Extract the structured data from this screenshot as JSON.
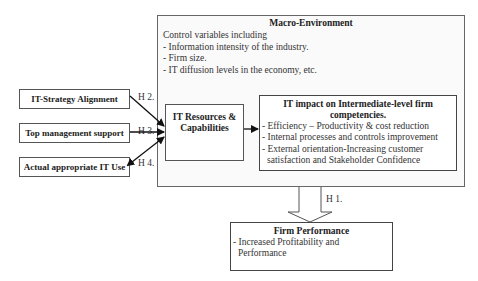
{
  "macro_environment": {
    "title": "Macro-Environment",
    "items": [
      "Control variables including",
      "- Information intensity of the industry.",
      "- Firm size.",
      "- IT diffusion levels in the economy, etc."
    ]
  },
  "antecedents": [
    {
      "label": "IT-Strategy Alignment",
      "hypothesis": "H 2."
    },
    {
      "label": "Top management  support",
      "hypothesis": "H 3."
    },
    {
      "label": "Actual appropriate IT Use",
      "hypothesis": "H 4."
    }
  ],
  "it_resources": {
    "line1": "IT Resources &",
    "line2": "Capabilities"
  },
  "it_impact": {
    "title_line1": "IT impact on Intermediate-level firm",
    "title_line2": "competencies.",
    "items": [
      "- Efficiency – Productivity & cost reduction",
      "- Internal processes and controls improvement",
      "- External orientation-Increasing customer",
      "  satisfaction and Stakeholder Confidence"
    ]
  },
  "outcome_hypothesis": "H 1.",
  "firm_performance": {
    "title": "Firm Performance",
    "items": [
      "- Increased Profitability and",
      "  Performance"
    ]
  }
}
